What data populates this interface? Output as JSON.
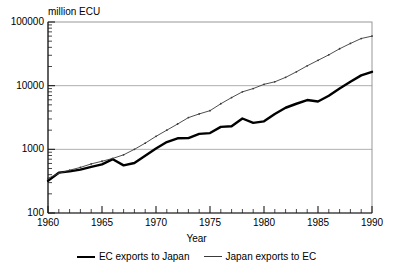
{
  "chart_data": {
    "type": "line",
    "title": "million ECU",
    "xlabel": "Year",
    "ylabel": "million ECU",
    "xlim": [
      1960,
      1990
    ],
    "ylim": [
      100,
      100000
    ],
    "yscale": "log",
    "grid": true,
    "grid_lines": [
      1000,
      10000
    ],
    "legend_position": "bottom",
    "y_ticks": [
      100,
      1000,
      10000,
      100000
    ],
    "y_tick_labels": [
      "100",
      "1000",
      "10000",
      "100000"
    ],
    "x_ticks": [
      1960,
      1965,
      1970,
      1975,
      1980,
      1985,
      1990
    ],
    "x_tick_labels": [
      "1960",
      "1965",
      "1970",
      "1975",
      "1980",
      "1985",
      "1990"
    ],
    "x_minor_tick_step": 1,
    "x": [
      1960,
      1961,
      1962,
      1963,
      1964,
      1965,
      1966,
      1967,
      1968,
      1969,
      1970,
      1971,
      1972,
      1973,
      1974,
      1975,
      1976,
      1977,
      1978,
      1979,
      1980,
      1981,
      1982,
      1983,
      1984,
      1985,
      1986,
      1987,
      1988,
      1989,
      1990
    ],
    "series": [
      {
        "name": "EC exports to Japan",
        "style": "thick-solid",
        "color": "#000000",
        "markers": false,
        "values": [
          320,
          430,
          450,
          480,
          530,
          580,
          700,
          560,
          610,
          790,
          1030,
          1300,
          1490,
          1500,
          1750,
          1800,
          2250,
          2300,
          3050,
          2600,
          2750,
          3600,
          4500,
          5200,
          5950,
          5650,
          6950,
          9000,
          11500,
          14500,
          16500
        ]
      },
      {
        "name": "Japan exports to EC",
        "style": "thin-solid-dotted",
        "color": "#3a3a3a",
        "markers": true,
        "values": [
          350,
          420,
          470,
          520,
          590,
          650,
          720,
          820,
          1000,
          1250,
          1600,
          2000,
          2500,
          3150,
          3600,
          4050,
          5200,
          6500,
          8000,
          9000,
          10500,
          11500,
          13500,
          16500,
          20500,
          25000,
          30500,
          38000,
          46000,
          55000,
          60000
        ]
      }
    ]
  },
  "legend": {
    "items": [
      {
        "label": "EC exports to Japan",
        "style": "thick"
      },
      {
        "label": "Japan exports to EC",
        "style": "thin"
      }
    ]
  }
}
